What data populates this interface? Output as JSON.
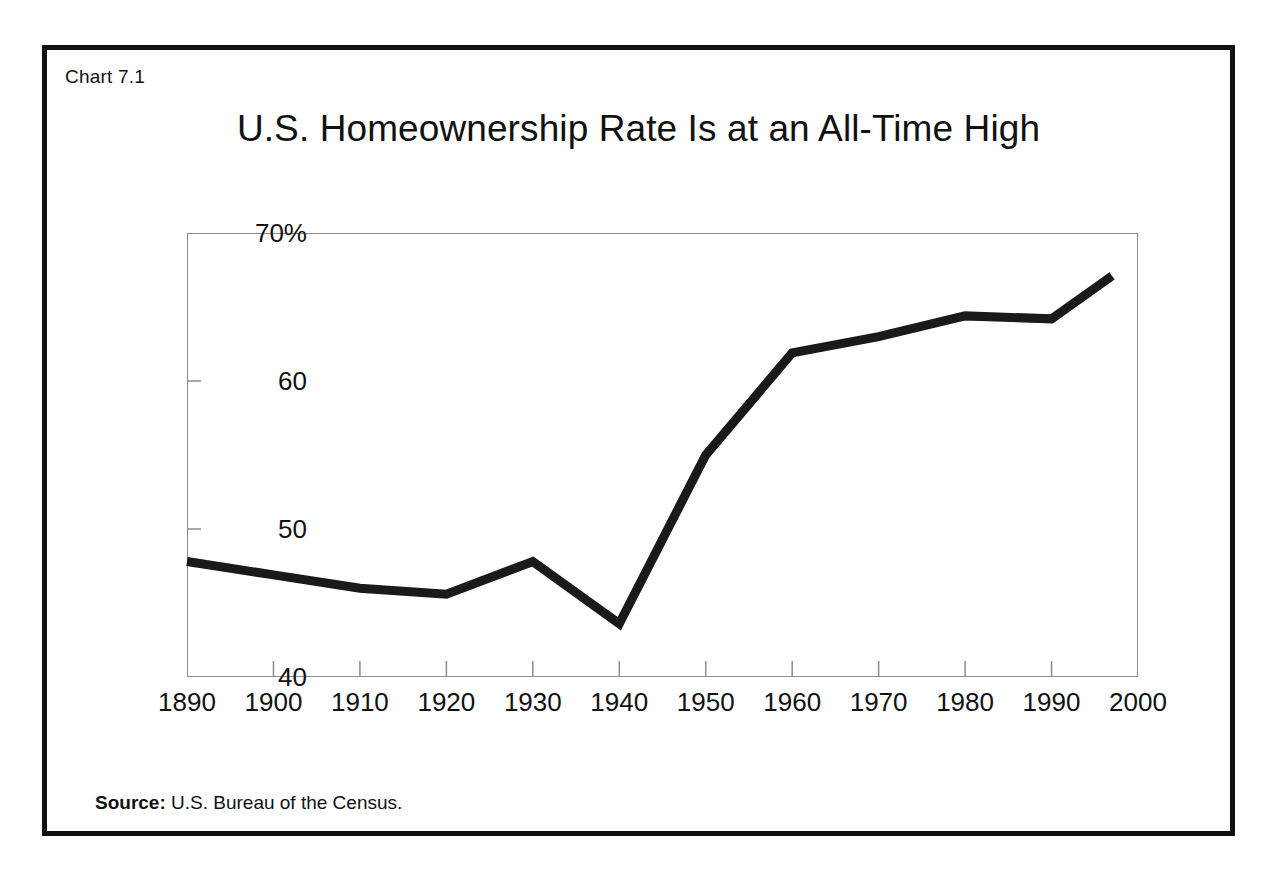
{
  "figure": {
    "chart_number": "Chart 7.1",
    "source_label": "Source:",
    "source_text": " U.S. Bureau of the Census."
  },
  "chart_data": {
    "type": "line",
    "title": "U.S. Homeownership Rate Is at an All-Time High",
    "xlabel": "",
    "ylabel": "",
    "xlim": [
      1890,
      2000
    ],
    "ylim": [
      40,
      70
    ],
    "grid": false,
    "legend": null,
    "x_tick_labels": [
      "1890",
      "1900",
      "1910",
      "1920",
      "1930",
      "1940",
      "1950",
      "1960",
      "1970",
      "1980",
      "1990",
      "2000"
    ],
    "x_ticks": [
      1890,
      1900,
      1910,
      1920,
      1930,
      1940,
      1950,
      1960,
      1970,
      1980,
      1990,
      2000
    ],
    "y_tick_labels": [
      "70%",
      "60",
      "50",
      "40"
    ],
    "y_ticks": [
      70,
      60,
      50,
      40
    ],
    "series": [
      {
        "name": "U.S. homeownership rate",
        "color": "#1a1a1a",
        "x": [
          1890,
          1900,
          1910,
          1920,
          1930,
          1940,
          1950,
          1960,
          1970,
          1980,
          1990,
          1997
        ],
        "values": [
          47.8,
          46.9,
          46.0,
          45.6,
          47.8,
          43.6,
          55.0,
          61.9,
          63.0,
          64.4,
          64.2,
          67.1
        ]
      }
    ]
  }
}
